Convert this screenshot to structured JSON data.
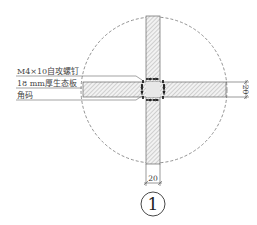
{
  "drawing": {
    "labels": [
      {
        "text": "M4×10自攻螺钉"
      },
      {
        "text": "18 mm厚生态板"
      },
      {
        "text": "角码"
      }
    ],
    "dimension_right": "20",
    "dimension_bottom": "20",
    "detail_marker": "1"
  }
}
